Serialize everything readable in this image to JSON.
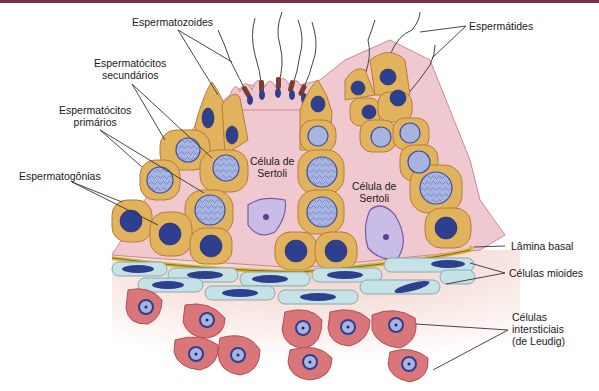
{
  "colors": {
    "top_border": "#7a2e48",
    "sertoli_cytoplasm": "#efc9cf",
    "germ_cell": "#e1b35c",
    "germ_cell_border": "#b97a3c",
    "nucleus_dark": "#2e3f8f",
    "nucleus_light": "#a8b4e0",
    "sertoli_nucleus": "#c9bde8",
    "basal_lamina": "#d9b53a",
    "myoid_cell": "#c7e2e6",
    "interstitial_bg": "#f3d9d2",
    "leydig_cell": "#d9767a"
  },
  "labels": {
    "espermatozoides": "Espermatozoides",
    "espermatides": "Espermátides",
    "espermatocitos_secundarios": [
      "Espermatócitos",
      "secundários"
    ],
    "espermatocitos_primarios": [
      "Espermatócitos",
      "primários"
    ],
    "espermatogonias": "Espermatogônias",
    "sertoli_1": [
      "Célula de",
      "Sertoli"
    ],
    "sertoli_2": [
      "Célula de",
      "Sertoli"
    ],
    "lamina_basal": "Lâmina basal",
    "celulas_mioides": "Células mioides",
    "celulas_intersticiais": [
      "Células",
      "intersticiais",
      "(de Leudig)"
    ]
  }
}
